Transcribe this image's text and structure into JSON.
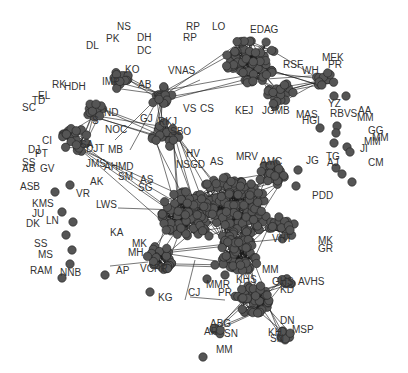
{
  "graph": {
    "type": "network",
    "node_color": "#555555",
    "edge_color": "#1a1a1a",
    "label_color": "#333333",
    "labels": [
      {
        "t": "NS",
        "x": 117,
        "y": 30
      },
      {
        "t": "PK",
        "x": 106,
        "y": 42
      },
      {
        "t": "DL",
        "x": 86,
        "y": 49
      },
      {
        "t": "DH",
        "x": 137,
        "y": 41
      },
      {
        "t": "DC",
        "x": 137,
        "y": 54
      },
      {
        "t": "KO",
        "x": 125,
        "y": 73
      },
      {
        "t": "IMP",
        "x": 102,
        "y": 85
      },
      {
        "t": "AB",
        "x": 138,
        "y": 88
      },
      {
        "t": "VNAS",
        "x": 168,
        "y": 74
      },
      {
        "t": "RK",
        "x": 52,
        "y": 88
      },
      {
        "t": "HDH",
        "x": 64,
        "y": 90
      },
      {
        "t": "EL",
        "x": 38,
        "y": 99
      },
      {
        "t": "TD",
        "x": 32,
        "y": 104
      },
      {
        "t": "SC",
        "x": 22,
        "y": 111
      },
      {
        "t": "ND",
        "x": 104,
        "y": 116
      },
      {
        "t": "S",
        "x": 92,
        "y": 124
      },
      {
        "t": "GJ",
        "x": 140,
        "y": 122
      },
      {
        "t": "RKJ",
        "x": 158,
        "y": 125
      },
      {
        "t": "VS",
        "x": 183,
        "y": 112
      },
      {
        "t": "CS",
        "x": 200,
        "y": 112
      },
      {
        "t": "RP",
        "x": 186,
        "y": 30
      },
      {
        "t": "LO",
        "x": 212,
        "y": 30
      },
      {
        "t": "RP",
        "x": 183,
        "y": 41
      },
      {
        "t": "EDAG",
        "x": 250,
        "y": 33
      },
      {
        "t": "RSF",
        "x": 283,
        "y": 68
      },
      {
        "t": "WH",
        "x": 302,
        "y": 74
      },
      {
        "t": "MEK",
        "x": 322,
        "y": 61
      },
      {
        "t": "PR",
        "x": 328,
        "y": 68
      },
      {
        "t": "KEJ",
        "x": 235,
        "y": 114
      },
      {
        "t": "JGMB",
        "x": 262,
        "y": 114
      },
      {
        "t": "YZ",
        "x": 328,
        "y": 107
      },
      {
        "t": "MAS",
        "x": 296,
        "y": 118
      },
      {
        "t": "HGI",
        "x": 302,
        "y": 124
      },
      {
        "t": "RBVS",
        "x": 330,
        "y": 117
      },
      {
        "t": "AA",
        "x": 358,
        "y": 114
      },
      {
        "t": "MM",
        "x": 357,
        "y": 121
      },
      {
        "t": "GG",
        "x": 368,
        "y": 134
      },
      {
        "t": "MM",
        "x": 372,
        "y": 141
      },
      {
        "t": "MM",
        "x": 364,
        "y": 145
      },
      {
        "t": "JI",
        "x": 360,
        "y": 152
      },
      {
        "t": "TG",
        "x": 326,
        "y": 160
      },
      {
        "t": "AJ",
        "x": 327,
        "y": 166
      },
      {
        "t": "CM",
        "x": 368,
        "y": 166
      },
      {
        "t": "JG",
        "x": 306,
        "y": 164
      },
      {
        "t": "CI",
        "x": 42,
        "y": 144
      },
      {
        "t": "DJ",
        "x": 28,
        "y": 153
      },
      {
        "t": "PT",
        "x": 35,
        "y": 157
      },
      {
        "t": "SA",
        "x": 80,
        "y": 148
      },
      {
        "t": "DJT",
        "x": 86,
        "y": 152
      },
      {
        "t": "NOC",
        "x": 105,
        "y": 133
      },
      {
        "t": "MB",
        "x": 108,
        "y": 153
      },
      {
        "t": "SBO",
        "x": 170,
        "y": 135
      },
      {
        "t": "HV",
        "x": 186,
        "y": 157
      },
      {
        "t": "AS",
        "x": 210,
        "y": 165
      },
      {
        "t": "MRV",
        "x": 236,
        "y": 160
      },
      {
        "t": "AMC",
        "x": 260,
        "y": 165
      },
      {
        "t": "SS",
        "x": 22,
        "y": 166
      },
      {
        "t": "AB",
        "x": 22,
        "y": 172
      },
      {
        "t": "GV",
        "x": 40,
        "y": 172
      },
      {
        "t": "JMS",
        "x": 86,
        "y": 167
      },
      {
        "t": "AHMD",
        "x": 104,
        "y": 170
      },
      {
        "t": "SM",
        "x": 118,
        "y": 180
      },
      {
        "t": "NSGD",
        "x": 176,
        "y": 168
      },
      {
        "t": "AS",
        "x": 140,
        "y": 183
      },
      {
        "t": "SG",
        "x": 138,
        "y": 191
      },
      {
        "t": "ASB",
        "x": 20,
        "y": 190
      },
      {
        "t": "AK",
        "x": 90,
        "y": 185
      },
      {
        "t": "VR",
        "x": 76,
        "y": 197
      },
      {
        "t": "PDD",
        "x": 312,
        "y": 199
      },
      {
        "t": "KMS",
        "x": 32,
        "y": 207
      },
      {
        "t": "JU",
        "x": 32,
        "y": 217
      },
      {
        "t": "LWS",
        "x": 96,
        "y": 208
      },
      {
        "t": "DK",
        "x": 26,
        "y": 227
      },
      {
        "t": "LN",
        "x": 46,
        "y": 224
      },
      {
        "t": "KA",
        "x": 110,
        "y": 236
      },
      {
        "t": "VHT",
        "x": 272,
        "y": 242
      },
      {
        "t": "MK",
        "x": 318,
        "y": 244
      },
      {
        "t": "GR",
        "x": 318,
        "y": 252
      },
      {
        "t": "SS",
        "x": 34,
        "y": 247
      },
      {
        "t": "MK",
        "x": 132,
        "y": 247
      },
      {
        "t": "MS",
        "x": 38,
        "y": 258
      },
      {
        "t": "MH",
        "x": 128,
        "y": 256
      },
      {
        "t": "RAM",
        "x": 30,
        "y": 274
      },
      {
        "t": "NNB",
        "x": 60,
        "y": 276
      },
      {
        "t": "AP",
        "x": 116,
        "y": 274
      },
      {
        "t": "VCPR",
        "x": 140,
        "y": 272
      },
      {
        "t": "MM",
        "x": 262,
        "y": 273
      },
      {
        "t": "GHS",
        "x": 272,
        "y": 285
      },
      {
        "t": "AVHS",
        "x": 298,
        "y": 285
      },
      {
        "t": "KD",
        "x": 280,
        "y": 293
      },
      {
        "t": "KHS",
        "x": 236,
        "y": 283
      },
      {
        "t": "KG",
        "x": 158,
        "y": 301
      },
      {
        "t": "CJ",
        "x": 188,
        "y": 296
      },
      {
        "t": "MMR",
        "x": 206,
        "y": 288
      },
      {
        "t": "PR",
        "x": 218,
        "y": 296
      },
      {
        "t": "ABG",
        "x": 210,
        "y": 327
      },
      {
        "t": "AR",
        "x": 204,
        "y": 335
      },
      {
        "t": "SN",
        "x": 224,
        "y": 337
      },
      {
        "t": "DN",
        "x": 280,
        "y": 324
      },
      {
        "t": "MSP",
        "x": 292,
        "y": 333
      },
      {
        "t": "SN",
        "x": 270,
        "y": 342
      },
      {
        "t": "KH",
        "x": 268,
        "y": 336
      },
      {
        "t": "MM",
        "x": 216,
        "y:": 352,
        "y": 353
      }
    ],
    "clusters": [
      {
        "name": "top-center-cluster",
        "cx": 250,
        "cy": 60,
        "r": 26,
        "n": 60
      },
      {
        "name": "top-right-sub",
        "cx": 280,
        "cy": 95,
        "r": 14,
        "n": 20
      },
      {
        "name": "main-core",
        "cx": 230,
        "cy": 210,
        "r": 38,
        "n": 140
      },
      {
        "name": "main-left",
        "cx": 185,
        "cy": 215,
        "r": 26,
        "n": 60
      },
      {
        "name": "right-mid-small",
        "cx": 272,
        "cy": 175,
        "r": 13,
        "n": 22
      },
      {
        "name": "right-lower-small",
        "cx": 282,
        "cy": 228,
        "r": 13,
        "n": 22
      },
      {
        "name": "lower-left-small",
        "cx": 160,
        "cy": 258,
        "r": 14,
        "n": 30
      },
      {
        "name": "lower-mid",
        "cx": 240,
        "cy": 255,
        "r": 20,
        "n": 50
      },
      {
        "name": "bottom-cluster",
        "cx": 252,
        "cy": 300,
        "r": 18,
        "n": 40
      },
      {
        "name": "left-cluster",
        "cx": 75,
        "cy": 140,
        "r": 14,
        "n": 22
      },
      {
        "name": "upper-left-cluster",
        "cx": 95,
        "cy": 110,
        "r": 10,
        "n": 16
      },
      {
        "name": "upper-mid-cluster",
        "cx": 120,
        "cy": 80,
        "r": 10,
        "n": 14
      },
      {
        "name": "upper-center",
        "cx": 160,
        "cy": 95,
        "r": 12,
        "n": 18
      },
      {
        "name": "gj-cluster",
        "cx": 165,
        "cy": 135,
        "r": 14,
        "n": 20
      },
      {
        "name": "wh-cluster",
        "cx": 325,
        "cy": 80,
        "r": 9,
        "n": 12
      },
      {
        "name": "ghs-small",
        "cx": 286,
        "cy": 283,
        "r": 6,
        "n": 8
      },
      {
        "name": "abg-small",
        "cx": 218,
        "cy": 330,
        "r": 5,
        "n": 6
      },
      {
        "name": "sn-small",
        "cx": 285,
        "cy": 335,
        "r": 6,
        "n": 8
      }
    ],
    "isolated_nodes": [
      [
        70,
        185
      ],
      [
        55,
        192
      ],
      [
        62,
        212
      ],
      [
        73,
        222
      ],
      [
        66,
        235
      ],
      [
        72,
        250
      ],
      [
        70,
        264
      ],
      [
        62,
        278
      ],
      [
        105,
        275
      ],
      [
        225,
        275
      ],
      [
        215,
        265
      ],
      [
        207,
        279
      ],
      [
        150,
        292
      ],
      [
        203,
        357
      ],
      [
        320,
        128
      ],
      [
        337,
        126
      ],
      [
        336,
        133
      ],
      [
        334,
        143
      ],
      [
        347,
        147
      ],
      [
        350,
        152
      ],
      [
        336,
        168
      ],
      [
        342,
        174
      ],
      [
        352,
        182
      ],
      [
        346,
        96
      ],
      [
        334,
        96
      ],
      [
        275,
        176
      ],
      [
        298,
        170
      ],
      [
        296,
        186
      ],
      [
        290,
        230
      ]
    ]
  }
}
